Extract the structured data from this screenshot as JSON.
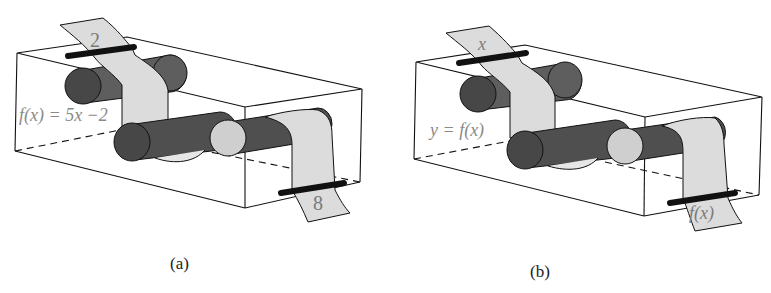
{
  "figure": {
    "panels": [
      {
        "id": "a",
        "caption": "(a)",
        "input_label": "2",
        "function_label": "f(x) = 5x −2",
        "output_label": "8"
      },
      {
        "id": "b",
        "caption": "(b)",
        "input_label": "x",
        "function_label": "y = f(x)",
        "output_label": "f(x)"
      }
    ],
    "colors": {
      "cylinder_dark": "#4a4a4a",
      "cylinder_mid": "#5e5e5e",
      "cylinder_end_light": "#cfcfcf",
      "tape": "#dcdcdc",
      "box_edge": "#111111",
      "slot": "#111111",
      "label_text": "#8a8a8a"
    }
  }
}
